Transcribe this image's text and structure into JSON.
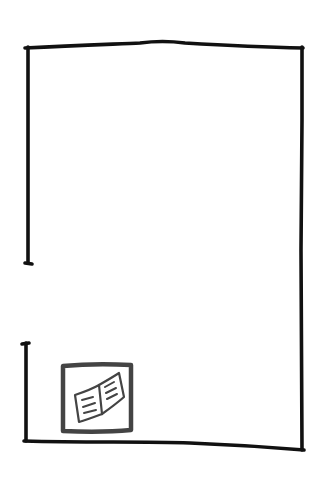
{
  "sketch": {
    "description": "Hand-drawn wireframe of a page/container with a gap on the left edge and a document icon in the bottom-left",
    "stroke_color": "#111111",
    "icon_stroke_color": "#444444",
    "background": "#ffffff",
    "frame": {
      "top_left": [
        25,
        48
      ],
      "top_right": [
        303,
        48
      ],
      "bottom_left": [
        24,
        441
      ],
      "bottom_right": [
        304,
        450
      ],
      "left_upper_segment": [
        48,
        263
      ],
      "left_lower_segment": [
        343,
        441
      ]
    },
    "icon": {
      "name": "open-document-icon",
      "box": [
        62,
        363,
        132,
        432
      ]
    }
  }
}
